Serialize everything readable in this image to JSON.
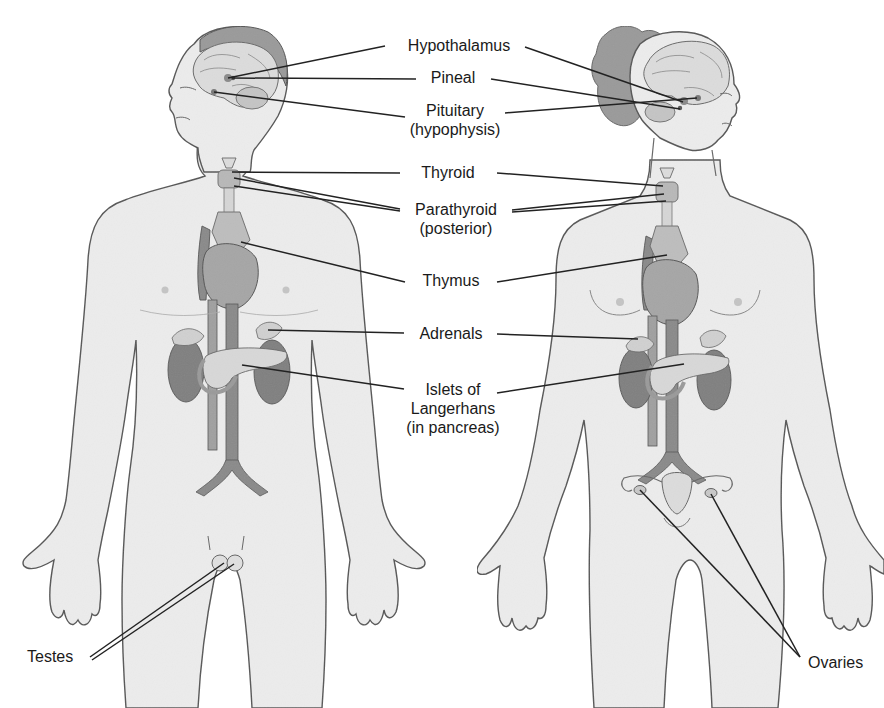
{
  "diagram": {
    "colors": {
      "skin": "#ececec",
      "outline": "#555555",
      "organ_dark": "#8a8a8a",
      "organ_mid": "#a8a8a8",
      "organ_light": "#d2d2d2",
      "leader_line": "#222222",
      "hair": "#9a9a9a"
    },
    "figures": [
      {
        "id": "male",
        "label": "Male figure"
      },
      {
        "id": "female",
        "label": "Female figure"
      }
    ],
    "labels": [
      {
        "id": "hypothalamus",
        "lines": [
          "Hypothalamus"
        ],
        "x": 459,
        "y": 36
      },
      {
        "id": "pineal",
        "lines": [
          "Pineal"
        ],
        "x": 459,
        "y": 68
      },
      {
        "id": "pituitary",
        "lines": [
          "Pituitary",
          "(hypophysis)"
        ],
        "x": 459,
        "y": 101
      },
      {
        "id": "thyroid",
        "lines": [
          "Thyroid"
        ],
        "x": 459,
        "y": 163
      },
      {
        "id": "parathyroid",
        "lines": [
          "Parathyroid",
          "(posterior)"
        ],
        "x": 459,
        "y": 200
      },
      {
        "id": "thymus",
        "lines": [
          "Thymus"
        ],
        "x": 459,
        "y": 271
      },
      {
        "id": "adrenals",
        "lines": [
          "Adrenals"
        ],
        "x": 459,
        "y": 324
      },
      {
        "id": "islets",
        "lines": [
          "Islets of",
          "Langerhans",
          "(in pancreas)"
        ],
        "x": 459,
        "y": 380
      },
      {
        "id": "testes",
        "lines": [
          "Testes"
        ],
        "x": 27,
        "y": 647
      },
      {
        "id": "ovaries",
        "lines": [
          "Ovaries"
        ],
        "x": 833,
        "y": 653
      }
    ],
    "leader_lines": {
      "male": [
        {
          "to": "hypothalamus",
          "from": [
            228,
            78
          ],
          "end": [
            385,
            46
          ]
        },
        {
          "to": "pineal",
          "from": [
            232,
            78
          ],
          "end": [
            416,
            79
          ]
        },
        {
          "to": "pituitary",
          "from": [
            214,
            92
          ],
          "end": [
            405,
            117
          ]
        },
        {
          "to": "thyroid",
          "from": [
            232,
            172
          ],
          "end": [
            400,
            173
          ]
        },
        {
          "to": "parathyroid",
          "from": [
            234,
            178
          ],
          "end": [
            400,
            209
          ]
        },
        {
          "to": "parathyroid",
          "from": [
            234,
            186
          ],
          "end": [
            400,
            211
          ]
        },
        {
          "to": "thymus",
          "from": [
            241,
            242
          ],
          "end": [
            405,
            282
          ]
        },
        {
          "to": "adrenals",
          "from": [
            268,
            330
          ],
          "end": [
            404,
            333
          ]
        },
        {
          "to": "islets",
          "from": [
            242,
            365
          ],
          "end": [
            404,
            389
          ]
        },
        {
          "to": "testes",
          "from": [
            224,
            563
          ],
          "end": [
            90,
            657
          ]
        },
        {
          "to": "testes",
          "from": [
            234,
            564
          ],
          "end": [
            92,
            660
          ]
        }
      ],
      "female": [
        {
          "to": "hypothalamus",
          "from": [
            683,
            102
          ],
          "end": [
            525,
            47
          ]
        },
        {
          "to": "pineal",
          "from": [
            680,
            109
          ],
          "end": [
            491,
            79
          ]
        },
        {
          "to": "pituitary",
          "from": [
            697,
            98
          ],
          "end": [
            505,
            113
          ]
        },
        {
          "to": "thyroid",
          "from": [
            663,
            186
          ],
          "end": [
            497,
            173
          ]
        },
        {
          "to": "parathyroid",
          "from": [
            664,
            194
          ],
          "end": [
            512,
            210
          ]
        },
        {
          "to": "parathyroid",
          "from": [
            666,
            201
          ],
          "end": [
            512,
            212
          ]
        },
        {
          "to": "thymus",
          "from": [
            667,
            255
          ],
          "end": [
            497,
            282
          ]
        },
        {
          "to": "adrenals",
          "from": [
            638,
            339
          ],
          "end": [
            497,
            334
          ]
        },
        {
          "to": "islets",
          "from": [
            684,
            364
          ],
          "end": [
            497,
            393
          ]
        },
        {
          "to": "ovaries",
          "from": [
            640,
            490
          ],
          "end": [
            800,
            657
          ]
        },
        {
          "to": "ovaries",
          "from": [
            711,
            494
          ],
          "end": [
            800,
            657
          ]
        }
      ]
    }
  }
}
